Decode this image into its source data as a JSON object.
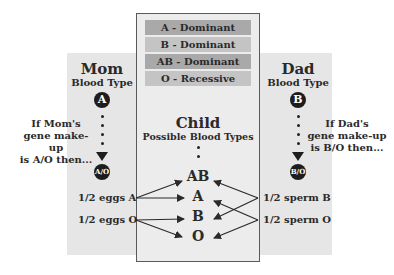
{
  "legend": [
    {
      "label": "A - Dominant",
      "color": "#a9a9a9"
    },
    {
      "label": "B - Dominant",
      "color": "#c4c4c4"
    },
    {
      "label": "AB - Dominant",
      "color": "#a9a9a9"
    },
    {
      "label": "O - Recessive",
      "color": "#c4c4c4"
    }
  ],
  "mom": {
    "title": "Mom",
    "subtitle": "Blood Type",
    "type": "A",
    "note": [
      "If Mom's",
      "gene make-up",
      "is A/O then..."
    ],
    "genotype": "A/O",
    "gametes": [
      "1/2 eggs A",
      "1/2 eggs O"
    ]
  },
  "dad": {
    "title": "Dad",
    "subtitle": "Blood Type",
    "type": "B",
    "note": [
      "If Dad's",
      "gene make-up",
      "is B/O then..."
    ],
    "genotype": "B/O",
    "gametes": [
      "1/2 sperm B",
      "1/2 sperm O"
    ]
  },
  "child": {
    "title": "Child",
    "subtitle": "Possible Blood Types",
    "types": [
      "AB",
      "A",
      "B",
      "O"
    ]
  },
  "colors": {
    "band": "#e6e6e6",
    "box_border": "#5a5a5a",
    "circle": "#1d1d1d",
    "text": "#2a2a2a"
  }
}
